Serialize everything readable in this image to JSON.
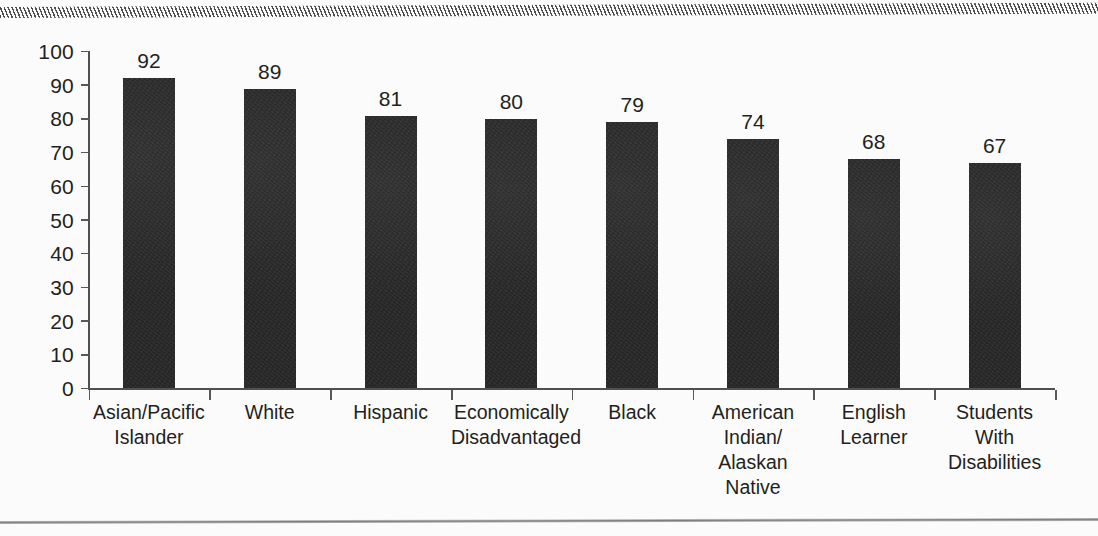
{
  "chart_data": {
    "type": "bar",
    "title": "",
    "subtitle": "",
    "xlabel": "",
    "ylabel": "",
    "ylim": [
      0,
      100
    ],
    "ytick_step": 10,
    "yticks": [
      "100",
      "90",
      "80",
      "70",
      "60",
      "50",
      "40",
      "30",
      "20",
      "10",
      "0"
    ],
    "grid": false,
    "legend": false,
    "legend_position": "none",
    "bar_color": "#262626",
    "axis_color": "#4e5052",
    "text_color": "#231f20",
    "background_color": "#fbfbfb",
    "categories": [
      "Asian/Pacific\nIslander",
      "White",
      "Hispanic",
      "Economically\nDisadvantaged",
      "Black",
      "American\nIndian/\nAlaskan\nNative",
      "English\nLearner",
      "Students\nWith\nDisabilities"
    ],
    "values": [
      92,
      89,
      81,
      80,
      79,
      74,
      68,
      67
    ],
    "value_labels": [
      "92",
      "89",
      "81",
      "80",
      "79",
      "74",
      "68",
      "67"
    ]
  },
  "decorations": {
    "top_rule": "hatched-rule",
    "bottom_rule": "hairline-rule"
  }
}
